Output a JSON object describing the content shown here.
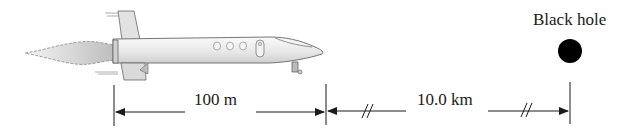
{
  "figure": {
    "object_label": "Black hole",
    "dimension_1": {
      "label": "100 m",
      "from": "rocket tail",
      "to": "rocket nose"
    },
    "dimension_2": {
      "label": "10.0 km",
      "from": "rocket nose",
      "to": "black hole",
      "broken_scale": true
    }
  },
  "colors": {
    "ink": "#1a1a1a",
    "rocket_body": "#eeeeee",
    "black_hole": "#000000",
    "background": "#ffffff"
  }
}
